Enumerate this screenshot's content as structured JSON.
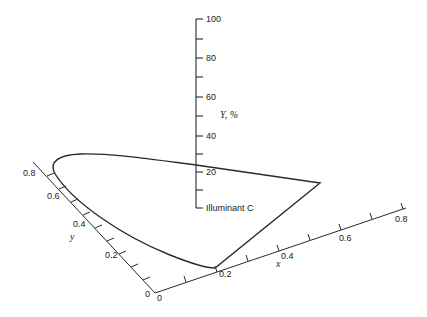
{
  "diagram": {
    "colors": {
      "line": "#2a2a2a",
      "background": "#ffffff",
      "text": "#222222"
    },
    "vertical_axis": {
      "label": "Y, %",
      "ticks": [
        {
          "label": "100",
          "y": 19
        },
        {
          "label": "80",
          "y": 58
        },
        {
          "label": "60",
          "y": 97
        },
        {
          "label": "40",
          "y": 136
        },
        {
          "label": "20",
          "y": 172
        }
      ],
      "base_label": "Illuminant C"
    },
    "x_axis": {
      "label": "x",
      "origin_label": "0",
      "ticks": [
        {
          "label": "0.2"
        },
        {
          "label": "0.4"
        },
        {
          "label": "0.6"
        },
        {
          "label": "0.8"
        }
      ]
    },
    "y_axis": {
      "label": "y",
      "origin_label": "0",
      "ticks": [
        {
          "label": "0.2"
        },
        {
          "label": "0.4"
        },
        {
          "label": "0.6"
        },
        {
          "label": "0.8"
        }
      ]
    }
  }
}
